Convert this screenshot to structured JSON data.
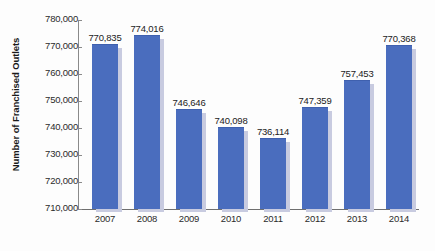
{
  "chart_data": {
    "type": "bar",
    "title": "",
    "xlabel": "",
    "ylabel": "Number of Franchised Outlets",
    "categories": [
      "2007",
      "2008",
      "2009",
      "2010",
      "2011",
      "2012",
      "2013",
      "2014"
    ],
    "values": [
      770835,
      774016,
      746646,
      740098,
      736114,
      747359,
      757453,
      770368
    ],
    "value_labels": [
      "770,835",
      "774,016",
      "746,646",
      "740,098",
      "736,114",
      "747,359",
      "757,453",
      "770,368"
    ],
    "ylim": [
      710000,
      780000
    ],
    "yticks": [
      710000,
      720000,
      730000,
      740000,
      750000,
      760000,
      770000,
      780000
    ],
    "ytick_labels": [
      "710,000",
      "720,000",
      "730,000",
      "740,000",
      "750,000",
      "760,000",
      "770,000",
      "780,000"
    ],
    "grid": false,
    "legend": null,
    "series": [
      {
        "name": "Number of Franchised Outlets",
        "values": [
          770835,
          774016,
          746646,
          740098,
          736114,
          747359,
          757453,
          770368
        ]
      }
    ],
    "colors": {
      "bar": "#4a6dbe",
      "bar_shadow": "#c8cbe0",
      "axis": "#6f6f6f",
      "text": "#222222",
      "background": "#fdfdfd"
    }
  }
}
